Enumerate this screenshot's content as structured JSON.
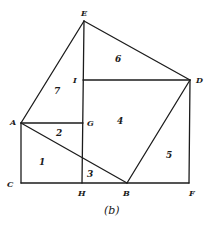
{
  "figure": {
    "caption": "(b)",
    "points": [
      {
        "id": "E",
        "label": "E"
      },
      {
        "id": "I",
        "label": "I"
      },
      {
        "id": "D",
        "label": "D"
      },
      {
        "id": "A",
        "label": "A"
      },
      {
        "id": "G",
        "label": "G"
      },
      {
        "id": "C",
        "label": "C"
      },
      {
        "id": "H",
        "label": "H"
      },
      {
        "id": "B",
        "label": "B"
      },
      {
        "id": "F",
        "label": "F"
      }
    ],
    "regions": [
      "1",
      "2",
      "3",
      "4",
      "5",
      "6",
      "7"
    ],
    "segments": [
      [
        "A",
        "E"
      ],
      [
        "E",
        "D"
      ],
      [
        "D",
        "B"
      ],
      [
        "B",
        "A"
      ],
      [
        "E",
        "H"
      ],
      [
        "I",
        "D"
      ],
      [
        "A",
        "G"
      ],
      [
        "A",
        "C"
      ],
      [
        "C",
        "F"
      ],
      [
        "F",
        "D"
      ]
    ]
  }
}
